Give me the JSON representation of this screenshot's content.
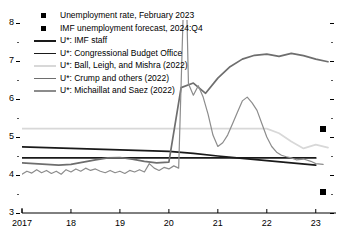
{
  "chart_data": {
    "type": "line",
    "title": "",
    "xlabel": "",
    "ylabel": "",
    "xlim": [
      2017.0,
      2023.25
    ],
    "ylim": [
      3,
      8
    ],
    "yticks": [
      3,
      4,
      5,
      6,
      7,
      8
    ],
    "ytick_labels": [
      "3",
      "4",
      "5",
      "6",
      "7",
      "8"
    ],
    "yminor_ticks": [
      3.5,
      4.5,
      5.5,
      6.5,
      7.5
    ],
    "xticks": [
      2017,
      2018,
      2019,
      2020,
      2021,
      2022,
      2023
    ],
    "xtick_labels": [
      "2017",
      "18",
      "19",
      "20",
      "21",
      "22",
      "23"
    ],
    "grid": false,
    "legend_position": "upper-left",
    "series": [
      {
        "name": "U*: IMF staff",
        "color": "#1a1a1a",
        "width": 1.7,
        "x": [
          2017.0,
          2017.25,
          2017.5,
          2017.75,
          2018.0,
          2018.25,
          2018.5,
          2018.75,
          2019.0,
          2019.25,
          2019.5,
          2019.75,
          2020.0,
          2020.25,
          2020.5,
          2020.75,
          2021.0,
          2021.25,
          2021.5,
          2021.75,
          2022.0,
          2022.25,
          2022.5,
          2022.75,
          2023.0
        ],
        "y": [
          4.45,
          4.45,
          4.45,
          4.45,
          4.45,
          4.45,
          4.45,
          4.45,
          4.45,
          4.45,
          4.45,
          4.45,
          4.45,
          4.45,
          4.45,
          4.45,
          4.45,
          4.45,
          4.45,
          4.45,
          4.45,
          4.45,
          4.45,
          4.45,
          4.45
        ]
      },
      {
        "name": "U*: Congressional Budget Office",
        "color": "#1a1a1a",
        "width": 1.7,
        "x": [
          2017.0,
          2017.5,
          2018.0,
          2018.5,
          2019.0,
          2019.5,
          2020.0,
          2020.5,
          2021.0,
          2021.5,
          2022.0,
          2022.5,
          2023.0
        ],
        "y": [
          4.74,
          4.72,
          4.7,
          4.68,
          4.66,
          4.64,
          4.62,
          4.57,
          4.5,
          4.44,
          4.38,
          4.32,
          4.26
        ]
      },
      {
        "name": "U*: Ball, Leigh, and Mishra (2022)",
        "color": "#d8d8d8",
        "width": 1.7,
        "x": [
          2017.0,
          2018.0,
          2019.0,
          2020.0,
          2020.5,
          2021.0,
          2021.5,
          2022.0,
          2022.25,
          2022.5,
          2022.75,
          2023.0,
          2023.25
        ],
        "y": [
          5.22,
          5.22,
          5.22,
          5.22,
          5.22,
          5.22,
          5.22,
          5.22,
          5.1,
          4.88,
          4.7,
          4.8,
          4.72
        ]
      },
      {
        "name": "U*: Crump and others (2022)",
        "color": "#6e6e6e",
        "width": 1.7,
        "x": [
          2017.0,
          2017.25,
          2017.5,
          2017.75,
          2018.0,
          2018.25,
          2018.5,
          2018.75,
          2019.0,
          2019.25,
          2019.5,
          2019.75,
          2020.0,
          2020.25,
          2020.5,
          2020.75,
          2021.0,
          2021.25,
          2021.5,
          2021.75,
          2022.0,
          2022.25,
          2022.5,
          2022.75,
          2023.0,
          2023.25
        ],
        "y": [
          4.32,
          4.3,
          4.28,
          4.26,
          4.28,
          4.34,
          4.4,
          4.45,
          4.46,
          4.42,
          4.36,
          4.32,
          4.34,
          6.3,
          6.42,
          6.15,
          6.55,
          6.85,
          7.05,
          7.15,
          7.18,
          7.12,
          7.2,
          7.14,
          7.05,
          6.98
        ]
      },
      {
        "name": "U*: Michaillat and Saez (2022)",
        "color": "#8c8c8c",
        "width": 1.2,
        "x": [
          2017.0,
          2017.1,
          2017.2,
          2017.3,
          2017.4,
          2017.5,
          2017.6,
          2017.7,
          2017.8,
          2017.9,
          2018.0,
          2018.1,
          2018.2,
          2018.3,
          2018.4,
          2018.5,
          2018.6,
          2018.7,
          2018.8,
          2018.9,
          2019.0,
          2019.1,
          2019.2,
          2019.3,
          2019.4,
          2019.5,
          2019.6,
          2019.7,
          2019.8,
          2019.9,
          2020.0,
          2020.1,
          2020.2,
          2020.3,
          2020.35,
          2020.4,
          2020.5,
          2020.6,
          2020.7,
          2020.8,
          2020.9,
          2021.0,
          2021.1,
          2021.2,
          2021.3,
          2021.4,
          2021.5,
          2021.6,
          2021.7,
          2021.8,
          2021.9,
          2022.0,
          2022.1,
          2022.2,
          2022.3,
          2022.4,
          2022.5,
          2022.6,
          2022.75,
          2022.9,
          2023.0,
          2023.15
        ],
        "y": [
          4.02,
          4.1,
          4.05,
          4.14,
          4.06,
          4.12,
          4.04,
          4.1,
          4.02,
          4.14,
          4.08,
          4.16,
          4.1,
          4.18,
          4.12,
          4.16,
          4.1,
          4.06,
          4.12,
          4.06,
          4.1,
          4.04,
          4.12,
          4.08,
          4.14,
          4.08,
          4.3,
          4.18,
          4.12,
          4.2,
          4.16,
          4.24,
          4.18,
          8.6,
          9.2,
          6.4,
          6.1,
          6.35,
          6.05,
          5.6,
          5.05,
          4.75,
          4.85,
          5.05,
          5.35,
          5.65,
          5.95,
          6.05,
          5.9,
          5.7,
          5.35,
          5.0,
          4.75,
          4.6,
          4.52,
          4.48,
          4.45,
          4.4,
          4.42,
          4.36,
          4.3,
          4.28
        ]
      }
    ],
    "markers": [
      {
        "name": "Unemployment rate, February 2023",
        "x": 2023.15,
        "y": 5.22,
        "color": "#000000"
      },
      {
        "name": "IMF unemployment forecast, 2024:Q4",
        "x": 2023.15,
        "y": 3.55,
        "color": "#000000"
      }
    ]
  },
  "legend": {
    "items": [
      {
        "label": "Unemployment rate, February 2023",
        "type": "square",
        "color": "#000000"
      },
      {
        "label": "IMF unemployment forecast, 2024:Q4",
        "type": "square",
        "color": "#000000"
      },
      {
        "label": "U*: IMF staff",
        "type": "line",
        "color": "#1a1a1a"
      },
      {
        "label": "U*: Congressional Budget Office",
        "type": "line",
        "color": "#1a1a1a"
      },
      {
        "label": "U*: Ball, Leigh, and Mishra (2022)",
        "type": "line",
        "color": "#d8d8d8"
      },
      {
        "label": "U*: Crump and others (2022)",
        "type": "line",
        "color": "#6e6e6e"
      },
      {
        "label": "U*: Michaillat and Saez (2022)",
        "type": "line",
        "color": "#8c8c8c"
      }
    ]
  }
}
